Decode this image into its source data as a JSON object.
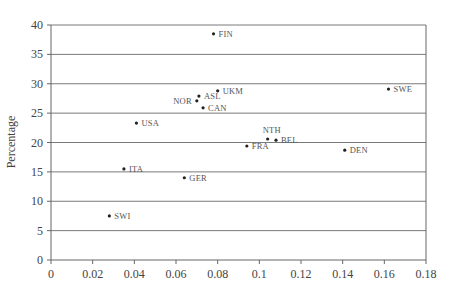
{
  "chart_data": {
    "type": "scatter",
    "title": "",
    "xlabel": "",
    "ylabel": "Percentage",
    "xlim": [
      0,
      0.18
    ],
    "ylim": [
      0,
      40
    ],
    "x_ticks": [
      "0",
      "0.02",
      "0.04",
      "0.06",
      "0.08",
      "0.1",
      "0.12",
      "0.14",
      "0.16",
      "0.18"
    ],
    "y_ticks": [
      "0",
      "5",
      "10",
      "15",
      "20",
      "25",
      "30",
      "35",
      "40"
    ],
    "grid": "horizontal",
    "legend": "none",
    "points": [
      {
        "label": "FIN",
        "x": 0.078,
        "y": 38.5
      },
      {
        "label": "UKM",
        "x": 0.08,
        "y": 28.8
      },
      {
        "label": "ASL",
        "x": 0.071,
        "y": 27.9
      },
      {
        "label": "NOR",
        "x": 0.07,
        "y": 27.1
      },
      {
        "label": "CAN",
        "x": 0.073,
        "y": 25.9
      },
      {
        "label": "SWE",
        "x": 0.162,
        "y": 29.1
      },
      {
        "label": "USA",
        "x": 0.041,
        "y": 23.3
      },
      {
        "label": "NTH",
        "x": 0.104,
        "y": 20.6
      },
      {
        "label": "BEL",
        "x": 0.108,
        "y": 20.4
      },
      {
        "label": "FRA",
        "x": 0.094,
        "y": 19.4
      },
      {
        "label": "DEN",
        "x": 0.141,
        "y": 18.7
      },
      {
        "label": "ITA",
        "x": 0.035,
        "y": 15.5
      },
      {
        "label": "GER",
        "x": 0.064,
        "y": 14.0
      },
      {
        "label": "SWI",
        "x": 0.028,
        "y": 7.5
      }
    ]
  },
  "label_positions": {
    "FIN": "right",
    "UKM": "right",
    "ASL": "right",
    "NOR": "left",
    "CAN": "right",
    "SWE": "right",
    "USA": "right",
    "NTH": "above",
    "BEL": "right",
    "FRA": "right",
    "DEN": "right",
    "ITA": "right",
    "GER": "right",
    "SWI": "right"
  }
}
